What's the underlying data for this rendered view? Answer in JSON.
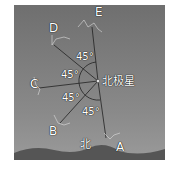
{
  "diagram": {
    "title": "",
    "polaris_label": "北极星",
    "north_label": "北",
    "positions": [
      "A",
      "B",
      "C",
      "D",
      "E"
    ],
    "angles": [
      "45°",
      "45°",
      "45°",
      "45°"
    ]
  }
}
